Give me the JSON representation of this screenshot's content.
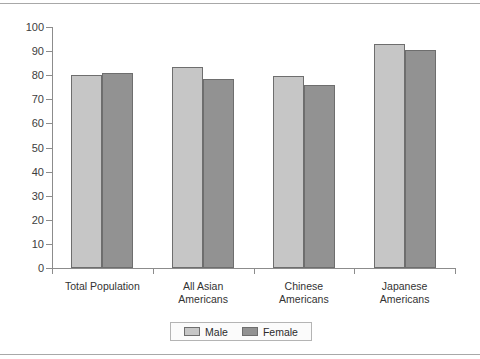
{
  "chart_data": {
    "type": "bar",
    "title": "",
    "subtitle": "",
    "xlabel": "",
    "ylabel": "",
    "ylim": [
      0,
      100
    ],
    "ytick_step": 10,
    "yticks": [
      0,
      10,
      20,
      30,
      40,
      50,
      60,
      70,
      80,
      90,
      100
    ],
    "ytick_labels": [
      "0",
      "10",
      "20",
      "30",
      "40",
      "50",
      "60",
      "70",
      "80",
      "90",
      "100"
    ],
    "grid": false,
    "legend_position": "bottom",
    "categories": [
      "Total Population",
      "All Asian Americans",
      "Chinese Americans",
      "Japanese Americans"
    ],
    "category_lines": [
      [
        "Total Population"
      ],
      [
        "All Asian",
        "Americans"
      ],
      [
        "Chinese",
        "Americans"
      ],
      [
        "Japanese",
        "Americans"
      ]
    ],
    "series": [
      {
        "name": "Male",
        "color": "#c6c6c6",
        "values": [
          80,
          83.5,
          79.5,
          93
        ]
      },
      {
        "name": "Female",
        "color": "#929292",
        "values": [
          81,
          78.5,
          76,
          90.5
        ]
      }
    ],
    "legend": [
      {
        "label": "Male",
        "color": "#c6c6c6"
      },
      {
        "label": "Female",
        "color": "#929292"
      }
    ]
  },
  "style": {
    "axis_color": "#8c8c8c",
    "bar_border": "#6e6e6e",
    "text_color": "#333333",
    "page_rule_color": "#a8a8a8",
    "background": "#ffffff"
  }
}
